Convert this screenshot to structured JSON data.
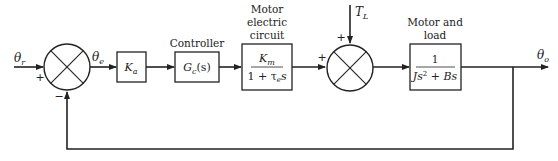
{
  "diagram": {
    "type": "block-diagram",
    "signals": {
      "input": "θr",
      "error": "θe",
      "disturbance": "TL",
      "output": "θo"
    },
    "summing_junctions": [
      {
        "id": "sum1",
        "signs": {
          "left": "+",
          "bottom": "−"
        }
      },
      {
        "id": "sum2",
        "signs": {
          "left": "+",
          "top": "+"
        }
      }
    ],
    "blocks": [
      {
        "id": "amplifier",
        "caption": "",
        "tf": "Ka"
      },
      {
        "id": "controller",
        "caption": "Controller",
        "tf": "Gc(s)"
      },
      {
        "id": "motor-electric",
        "caption_lines": [
          "Motor",
          "electric",
          "circuit"
        ],
        "numerator": "Km",
        "denominator": "1 + τe s"
      },
      {
        "id": "motor-load",
        "caption_lines": [
          "Motor and",
          "load"
        ],
        "numerator": "1",
        "denominator": "Js² + Bs"
      }
    ],
    "feedback": "unity, from θo to sum1 (negative)"
  },
  "labels": {
    "theta_r_main": "θ",
    "theta_r_sub": "r",
    "theta_e_main": "θ",
    "theta_e_sub": "e",
    "theta_o_main": "θ",
    "theta_o_sub": "o",
    "tl_main": "T",
    "tl_sub": "L",
    "plus": "+",
    "minus": "−",
    "ka_main": "K",
    "ka_sub": "a",
    "gc_main": "G",
    "gc_sub": "c",
    "gc_arg": "(s)",
    "controller_caption": "Controller",
    "motor_elec_cap1": "Motor",
    "motor_elec_cap2": "electric",
    "motor_elec_cap3": "circuit",
    "km_main": "K",
    "km_sub": "m",
    "km_den_a": "1 + τ",
    "km_den_sub": "e",
    "km_den_b": "s",
    "motor_load_cap1": "Motor and",
    "motor_load_cap2": "load",
    "ml_num": "1",
    "ml_den_a": "Js",
    "ml_den_sup": "2",
    "ml_den_b": " + Bs"
  }
}
